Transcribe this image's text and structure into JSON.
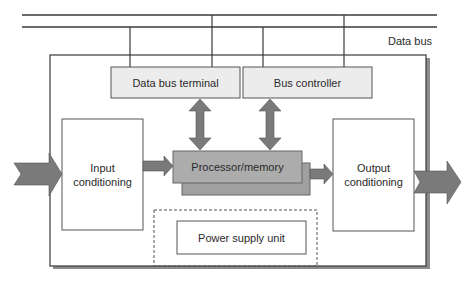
{
  "diagram": {
    "bus_label": "Data bus",
    "blocks": {
      "data_bus_terminal": "Data bus terminal",
      "bus_controller": "Bus controller",
      "input_conditioning": "Input conditioning",
      "processor_memory": "Processor/memory",
      "output_conditioning": "Output conditioning",
      "power_supply_unit": "Power supply unit"
    },
    "colors": {
      "line": "#3a3a3a",
      "box_fill_light": "#ececec",
      "box_fill_processor": "#a9a9a9",
      "arrow_fill": "#7a7a7a",
      "shadow": "#8c8c8c"
    }
  }
}
